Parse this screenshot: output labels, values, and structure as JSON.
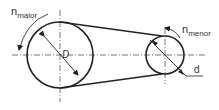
{
  "diagram": {
    "type": "belt-drive",
    "pulleys": [
      {
        "name": "large-pulley",
        "label_n": "n",
        "label_n_sub": "maior",
        "diameter_label": "D"
      },
      {
        "name": "small-pulley",
        "label_n": "n",
        "label_n_sub": "menor",
        "diameter_label": "d"
      }
    ]
  }
}
